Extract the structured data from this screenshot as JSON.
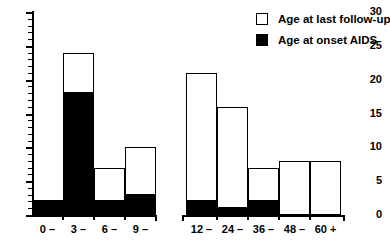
{
  "chart_data": {
    "type": "bar",
    "subtype": "stacked-bar",
    "title": "",
    "xlabel": "",
    "ylabel": "",
    "ylim": [
      0,
      30
    ],
    "y_major_ticks": [
      0,
      5,
      10,
      15,
      20,
      25,
      30
    ],
    "y_minor_tick_step": 1,
    "grid": false,
    "axis_break": true,
    "legend_position": "top-right",
    "categories": [
      "0 –",
      "3 –",
      "6 –",
      "9 –",
      "12 –",
      "24 –",
      "36 –",
      "48 –",
      "60 +"
    ],
    "groups": [
      {
        "name": "left",
        "categories": [
          "0 –",
          "3 –",
          "6 –",
          "9 –"
        ]
      },
      {
        "name": "right",
        "categories": [
          "12 –",
          "24 –",
          "36 –",
          "48 –",
          "60 +"
        ]
      }
    ],
    "series": [
      {
        "name": "Age at onset AIDS",
        "color": "#000000",
        "values": [
          2,
          18,
          2,
          3,
          2,
          1,
          2,
          0,
          0
        ]
      },
      {
        "name": "Age at last follow-up",
        "color": "#ffffff",
        "values": [
          0,
          6,
          5,
          7,
          19,
          15,
          5,
          8,
          8
        ]
      }
    ],
    "totals": [
      2,
      24,
      7,
      10,
      21,
      16,
      7,
      8,
      8
    ]
  },
  "legend": {
    "items": [
      {
        "label": "Age at last follow-up",
        "swatch": "outline"
      },
      {
        "label": "Age at onset AIDS",
        "swatch": "filled"
      }
    ]
  },
  "y_axis": {
    "ticks": [
      {
        "value": 30,
        "label": "30"
      },
      {
        "value": 25,
        "label": "25"
      },
      {
        "value": 20,
        "label": "20"
      },
      {
        "value": 15,
        "label": "15"
      },
      {
        "value": 10,
        "label": "10"
      },
      {
        "value": 5,
        "label": "5"
      },
      {
        "value": 0,
        "label": "0"
      }
    ]
  },
  "x_axis": {
    "labels": [
      "0 –",
      "3 –",
      "6 –",
      "9 –",
      "12 –",
      "24 –",
      "36 –",
      "48 –",
      "60 +"
    ]
  }
}
